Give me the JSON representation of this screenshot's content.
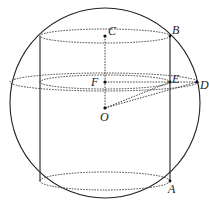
{
  "figure": {
    "colors": {
      "line": "#222222",
      "background": "#ffffff"
    },
    "points": {
      "A": {
        "label": "A",
        "x": 170,
        "y": 181
      },
      "B": {
        "label": "B",
        "x": 170,
        "y": 36
      },
      "C": {
        "label": "C",
        "x": 105,
        "y": 36
      },
      "D": {
        "label": "D",
        "x": 197,
        "y": 82
      },
      "E": {
        "label": "E",
        "x": 170,
        "y": 82
      },
      "F": {
        "label": "F",
        "x": 105,
        "y": 82
      },
      "O": {
        "label": "O",
        "x": 105,
        "y": 108
      }
    },
    "shapes": {
      "sphere": {
        "cx": 105,
        "cy": 103,
        "r": 95
      },
      "cylinder": {
        "left_x": 40,
        "right_x": 170,
        "top_y": 36,
        "bottom_y": 181
      }
    }
  }
}
